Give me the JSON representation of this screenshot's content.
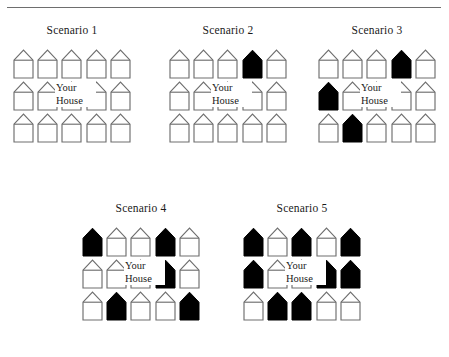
{
  "figure": {
    "has_top_rule": true,
    "your_house_label": {
      "line1": "Your",
      "line2": "House"
    },
    "colors": {
      "house_outline": "#6e6e6e",
      "house_white_fill": "#ffffff",
      "house_black_fill": "#000000",
      "rule": "#6e6e6e",
      "text": "#1a1a1a",
      "background": "#ffffff"
    },
    "legend": {
      "white_house_meaning": "white house",
      "black_house_meaning": "black house"
    }
  },
  "scenarios": [
    {
      "id": "scenario-1",
      "title": "Scenario 1",
      "x": 13,
      "y": 24,
      "your_house_row": 1,
      "your_house_index": 2,
      "black_count": 0,
      "rows": [
        [
          "white",
          "white",
          "white",
          "white",
          "white"
        ],
        [
          "white",
          "white",
          "white",
          "white",
          "white"
        ],
        [
          "white",
          "white",
          "white",
          "white",
          "white"
        ]
      ]
    },
    {
      "id": "scenario-2",
      "title": "Scenario 2",
      "x": 169,
      "y": 24,
      "your_house_row": 1,
      "your_house_index": 2,
      "black_count": 1,
      "rows": [
        [
          "white",
          "white",
          "white",
          "black",
          "white"
        ],
        [
          "white",
          "white",
          "white",
          "white",
          "white"
        ],
        [
          "white",
          "white",
          "white",
          "white",
          "white"
        ]
      ]
    },
    {
      "id": "scenario-3",
      "title": "Scenario 3",
      "x": 318,
      "y": 24,
      "your_house_row": 1,
      "your_house_index": 2,
      "black_count": 3,
      "rows": [
        [
          "white",
          "white",
          "white",
          "black",
          "white"
        ],
        [
          "black",
          "white",
          "white",
          "white",
          "white"
        ],
        [
          "white",
          "black",
          "white",
          "white",
          "white"
        ]
      ]
    },
    {
      "id": "scenario-4",
      "title": "Scenario 4",
      "x": 82,
      "y": 202,
      "your_house_row": 1,
      "your_house_index": 2,
      "black_count": 5,
      "rows": [
        [
          "black",
          "white",
          "white",
          "black",
          "white"
        ],
        [
          "white",
          "white",
          "white",
          "black",
          "white"
        ],
        [
          "white",
          "black",
          "white",
          "white",
          "black"
        ]
      ]
    },
    {
      "id": "scenario-5",
      "title": "Scenario 5",
      "x": 243,
      "y": 202,
      "your_house_row": 1,
      "your_house_index": 2,
      "black_count": 8,
      "rows": [
        [
          "black",
          "white",
          "black",
          "white",
          "black"
        ],
        [
          "black",
          "white",
          "white",
          "black",
          "black"
        ],
        [
          "white",
          "black",
          "black",
          "white",
          "white"
        ]
      ]
    }
  ]
}
